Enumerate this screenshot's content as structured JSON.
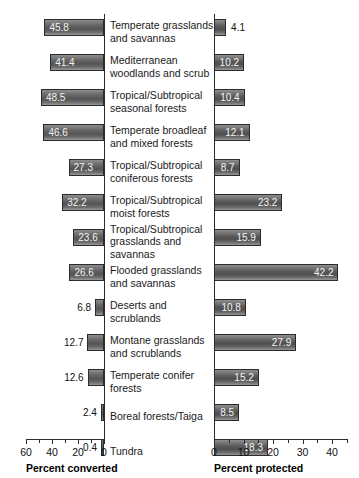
{
  "chart_data": {
    "type": "bar",
    "title": "",
    "orientation": "horizontal",
    "layout": "back-to-back paired horizontal bars",
    "categories": [
      "Temperate grasslands and savannas",
      "Mediterranean woodlands and scrub",
      "Tropical/Subtropical seasonal forests",
      "Temperate broadleaf and mixed forests",
      "Tropical/Subtropical coniferous forests",
      "Tropical/Subtropical moist forests",
      "Tropical/Subtropical grasslands and savannas",
      "Flooded grasslands and savannas",
      "Deserts and scrublands",
      "Montane grasslands and scrublands",
      "Temperate conifer forests",
      "Boreal forests/Taiga",
      "Tundra"
    ],
    "series": [
      {
        "name": "Percent converted",
        "axis": "left",
        "values": [
          45.8,
          41.4,
          48.5,
          46.6,
          27.3,
          32.2,
          23.6,
          26.6,
          6.8,
          12.7,
          12.6,
          2.4,
          0.4
        ]
      },
      {
        "name": "Percent protected",
        "axis": "right",
        "values": [
          4.1,
          10.2,
          10.4,
          12.1,
          8.7,
          23.2,
          15.9,
          42.2,
          10.8,
          27.9,
          15.2,
          8.5,
          18.3
        ]
      }
    ],
    "left_axis": {
      "label": "Percent converted",
      "ticks": [
        60,
        40,
        20,
        0
      ],
      "minor_ticks": [
        50,
        30,
        10
      ],
      "range": [
        60,
        0
      ],
      "direction": "reversed"
    },
    "right_axis": {
      "label": "Percent protected",
      "ticks": [
        0,
        10,
        20,
        30,
        40
      ],
      "minor_ticks": [
        5,
        15,
        25,
        35,
        45
      ],
      "range": [
        0,
        46
      ],
      "direction": "normal"
    },
    "grid": false,
    "legend": "none",
    "bar_color": "#5a5a5a",
    "bar_edge_color": "#2b2b2b",
    "inside_label_color": "#f2f2f2",
    "outside_label_color": "#111111"
  },
  "rows": [
    {
      "label_lines": [
        "Temperate grasslands",
        "and savannas"
      ],
      "left": {
        "value": "45.8",
        "inside": true
      },
      "right": {
        "value": "4.1",
        "inside": false
      }
    },
    {
      "label_lines": [
        "Mediterranean",
        "woodlands and scrub"
      ],
      "left": {
        "value": "41.4",
        "inside": true
      },
      "right": {
        "value": "10.2",
        "inside": true
      }
    },
    {
      "label_lines": [
        "Tropical/Subtropical",
        "seasonal forests"
      ],
      "left": {
        "value": "48.5",
        "inside": true
      },
      "right": {
        "value": "10.4",
        "inside": true
      }
    },
    {
      "label_lines": [
        "Temperate broadleaf",
        "and mixed forests"
      ],
      "left": {
        "value": "46.6",
        "inside": true
      },
      "right": {
        "value": "12.1",
        "inside": true
      }
    },
    {
      "label_lines": [
        "Tropical/Subtropical",
        "coniferous forests"
      ],
      "left": {
        "value": "27.3",
        "inside": true
      },
      "right": {
        "value": "8.7",
        "inside": true
      }
    },
    {
      "label_lines": [
        "Tropical/Subtropical",
        "moist forests"
      ],
      "left": {
        "value": "32.2",
        "inside": true
      },
      "right": {
        "value": "23.2",
        "inside": true
      }
    },
    {
      "label_lines": [
        "Tropical/Subtropical",
        "grasslands and savannas"
      ],
      "left": {
        "value": "23.6",
        "inside": true
      },
      "right": {
        "value": "15.9",
        "inside": true
      }
    },
    {
      "label_lines": [
        "Flooded grasslands",
        "and savannas"
      ],
      "left": {
        "value": "26.6",
        "inside": true
      },
      "right": {
        "value": "42.2",
        "inside": true
      }
    },
    {
      "label_lines": [
        "Deserts and scrublands"
      ],
      "left": {
        "value": "6.8",
        "inside": false
      },
      "right": {
        "value": "10.8",
        "inside": true
      }
    },
    {
      "label_lines": [
        "Montane grasslands",
        "and scrublands"
      ],
      "left": {
        "value": "12.7",
        "inside": false
      },
      "right": {
        "value": "27.9",
        "inside": true
      }
    },
    {
      "label_lines": [
        "Temperate conifer",
        "forests"
      ],
      "left": {
        "value": "12.6",
        "inside": false
      },
      "right": {
        "value": "15.2",
        "inside": true
      }
    },
    {
      "label_lines": [
        "Boreal forests/Taiga"
      ],
      "left": {
        "value": "2.4",
        "inside": false
      },
      "right": {
        "value": "8.5",
        "inside": true
      }
    },
    {
      "label_lines": [
        "Tundra"
      ],
      "left": {
        "value": "0.4",
        "inside": false
      },
      "right": {
        "value": "18.3",
        "inside": true
      }
    }
  ],
  "axes": {
    "left": {
      "title": "Percent converted",
      "tick_labels": [
        "60",
        "40",
        "20",
        "0"
      ]
    },
    "right": {
      "title": "Percent protected",
      "tick_labels": [
        "0",
        "10",
        "20",
        "30",
        "40"
      ]
    }
  }
}
